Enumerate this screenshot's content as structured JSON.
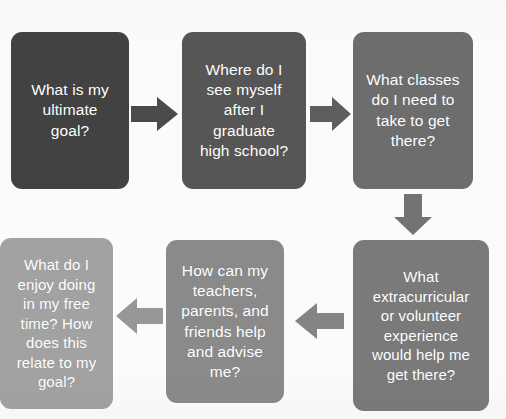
{
  "diagram": {
    "type": "flowchart",
    "title": "",
    "background_color": "#fbfbfa",
    "text_color": "#ffffff",
    "nodes": [
      {
        "id": "node-1",
        "order": 1,
        "text": "What is my\nultimate\ngoal?",
        "color": "#424242",
        "shape": "rounded-rectangle"
      },
      {
        "id": "node-2",
        "order": 2,
        "text": "Where do I\nsee myself\nafter I\ngraduate\nhigh school?",
        "color": "#565656",
        "shape": "rounded-rectangle"
      },
      {
        "id": "node-3",
        "order": 3,
        "text": "What classes\ndo I need to\ntake to get\nthere?",
        "color": "#6d6d6d",
        "shape": "rounded-rectangle"
      },
      {
        "id": "node-4",
        "order": 4,
        "text": "What\nextracurricular\nor volunteer\nexperience\nwould help me\nget there?",
        "color": "#7a7a7a",
        "shape": "rounded-rectangle"
      },
      {
        "id": "node-5",
        "order": 5,
        "text": "How can my\nteachers,\nparents, and\nfriends help\nand advise\nme?",
        "color": "#8a8a8a",
        "shape": "rounded-rectangle"
      },
      {
        "id": "node-6",
        "order": 6,
        "text": "What do I\nenjoy doing\nin my free\ntime? How\ndoes this\nrelate to my\ngoal?",
        "color": "#a2a2a2",
        "shape": "rounded-rectangle"
      }
    ],
    "arrows": [
      {
        "id": "arrow-1",
        "from": "node-1",
        "to": "node-2",
        "direction": "right",
        "color": "#4b4b4b"
      },
      {
        "id": "arrow-2",
        "from": "node-2",
        "to": "node-3",
        "direction": "right",
        "color": "#5e5e5e"
      },
      {
        "id": "arrow-3",
        "from": "node-3",
        "to": "node-4",
        "direction": "down",
        "color": "#737373"
      },
      {
        "id": "arrow-4",
        "from": "node-4",
        "to": "node-5",
        "direction": "left",
        "color": "#848484"
      },
      {
        "id": "arrow-5",
        "from": "node-5",
        "to": "node-6",
        "direction": "left",
        "color": "#979797"
      }
    ]
  }
}
